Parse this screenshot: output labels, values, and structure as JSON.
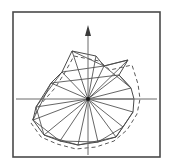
{
  "figure": {
    "type": "polar-star-polygon",
    "background_color": "#ffffff",
    "frame": {
      "name": "plot-frame",
      "x": 13,
      "y": 12,
      "width": 147,
      "height": 145,
      "stroke_color": "#4a4a4a",
      "stroke_width": 1.6,
      "fill": "none"
    },
    "center": {
      "x": 88,
      "y": 99,
      "marker_size": 4,
      "color": "#1a1a1a"
    },
    "axes": {
      "stroke_color": "#6b6b6b",
      "stroke_width": 1.0,
      "horizontal": {
        "name": "x-axis",
        "x1": 16,
        "y1": 99,
        "x2": 157,
        "y2": 99
      },
      "vertical": {
        "name": "y-axis",
        "x1": 88,
        "y1": 28,
        "x2": 88,
        "y2": 155
      },
      "arrow": {
        "name": "y-axis-arrow",
        "tip_x": 88,
        "tip_y": 25,
        "base_y": 36,
        "half_width": 3,
        "color": "#3a3a3a"
      }
    },
    "solid_contour": {
      "name": "solid-shape-contour",
      "stroke_color": "#4a4a4a",
      "stroke_width": 1.0,
      "fill": "none",
      "closed": true
    },
    "dashed_contour": {
      "name": "dashed-reference-contour",
      "stroke_color": "#5a5a5a",
      "stroke_width": 1.0,
      "dash_pattern": "4,3",
      "fill": "none",
      "closed": true
    },
    "spokes": {
      "name": "radial-spokes",
      "stroke_color": "#4a4a4a",
      "stroke_width": 0.85,
      "count": 18
    }
  },
  "chart_data": {
    "type": "line",
    "subtitle": "",
    "xlabel": "",
    "ylabel": "",
    "grid": false,
    "legend": "none",
    "axis_origin_px": [
      88,
      99
    ],
    "angle_unit": "degrees",
    "radius_unit": "pixels",
    "series": [
      {
        "name": "solid contour",
        "style": "solid",
        "points_px": [
          [
            72,
            51
          ],
          [
            96,
            56
          ],
          [
            104,
            66
          ],
          [
            128,
            60
          ],
          [
            119,
            75
          ],
          [
            131,
            88
          ],
          [
            134,
            99
          ],
          [
            133,
            112
          ],
          [
            123,
            127
          ],
          [
            116,
            137
          ],
          [
            98,
            142
          ],
          [
            78,
            145
          ],
          [
            60,
            141
          ],
          [
            44,
            135
          ],
          [
            33,
            120
          ],
          [
            36,
            107
          ],
          [
            51,
            83
          ],
          [
            62,
            72
          ]
        ],
        "radii": [
          50,
          44,
          35,
          53,
          40,
          44,
          46,
          46,
          45,
          48,
          44,
          46,
          51,
          57,
          59,
          53,
          39,
          37
        ],
        "angles": [
          106,
          82,
          69,
          45,
          28,
          15,
          0,
          345,
          320,
          304,
          281,
          264,
          248,
          235,
          219,
          199,
          157,
          130
        ]
      },
      {
        "name": "dashed contour",
        "style": "dashed",
        "points_px": [
          [
            74,
            56
          ],
          [
            99,
            61
          ],
          [
            110,
            70
          ],
          [
            132,
            65
          ],
          [
            138,
            84
          ],
          [
            140,
            99
          ],
          [
            137,
            114
          ],
          [
            127,
            130
          ],
          [
            114,
            141
          ],
          [
            96,
            147
          ],
          [
            76,
            149
          ],
          [
            57,
            144
          ],
          [
            41,
            137
          ],
          [
            31,
            123
          ],
          [
            40,
            105
          ],
          [
            55,
            88
          ],
          [
            64,
            74
          ]
        ],
        "radii": [
          45,
          40,
          35,
          53,
          52,
          52,
          52,
          48,
          49,
          48,
          51,
          55,
          58,
          61,
          48,
          35,
          34
        ],
        "angles": [
          108,
          80,
          68,
          46,
          19,
          0,
          343,
          318,
          302,
          283,
          264,
          248,
          235,
          217,
          193,
          163,
          135
        ]
      }
    ],
    "spokes_px": [
      [
        88,
        99,
        72,
        51
      ],
      [
        88,
        99,
        96,
        56
      ],
      [
        88,
        99,
        104,
        66
      ],
      [
        88,
        99,
        128,
        60
      ],
      [
        88,
        99,
        119,
        75
      ],
      [
        88,
        99,
        131,
        88
      ],
      [
        88,
        99,
        134,
        99
      ],
      [
        88,
        99,
        133,
        112
      ],
      [
        88,
        99,
        123,
        127
      ],
      [
        88,
        99,
        116,
        137
      ],
      [
        88,
        99,
        98,
        142
      ],
      [
        88,
        99,
        78,
        145
      ],
      [
        88,
        99,
        60,
        141
      ],
      [
        88,
        99,
        44,
        135
      ],
      [
        88,
        99,
        33,
        120
      ],
      [
        88,
        99,
        36,
        107
      ],
      [
        88,
        99,
        51,
        83
      ],
      [
        88,
        99,
        62,
        72
      ]
    ],
    "chords_px": [
      [
        72,
        51,
        104,
        66
      ],
      [
        104,
        66,
        128,
        60
      ],
      [
        62,
        72,
        104,
        66
      ],
      [
        51,
        83,
        119,
        75
      ],
      [
        36,
        107,
        62,
        72
      ],
      [
        33,
        120,
        51,
        83
      ],
      [
        44,
        135,
        36,
        107
      ],
      [
        60,
        141,
        33,
        120
      ],
      [
        78,
        145,
        44,
        135
      ],
      [
        98,
        142,
        60,
        141
      ],
      [
        116,
        137,
        78,
        145
      ],
      [
        123,
        127,
        98,
        142
      ],
      [
        133,
        112,
        116,
        137
      ],
      [
        131,
        88,
        104,
        66
      ],
      [
        119,
        75,
        131,
        88
      ]
    ]
  }
}
